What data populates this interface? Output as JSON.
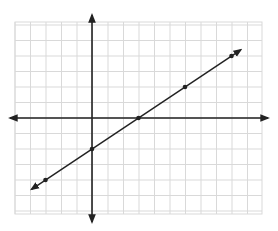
{
  "chart_data": {
    "type": "line",
    "title": "",
    "xlabel": "",
    "ylabel": "",
    "equation": "y = (2/3)x - 2",
    "slope": 0.6667,
    "y_intercept": -2,
    "x_intercept": 3,
    "grid": true,
    "xlim": [
      -5,
      11
    ],
    "ylim": [
      -6.2,
      6.2
    ],
    "series": [
      {
        "name": "line",
        "points": [
          [
            -3,
            -4
          ],
          [
            0,
            -2
          ],
          [
            3,
            0
          ],
          [
            6,
            2
          ],
          [
            9,
            4
          ]
        ],
        "x": [
          -3,
          0,
          3,
          6,
          9
        ],
        "y": [
          -4,
          -2,
          0,
          2,
          4
        ]
      }
    ],
    "tick_labels": false,
    "legend": "none"
  },
  "style": {
    "grid_color": "#d9d9d9",
    "axis_color": "#222222",
    "line_color": "#222222",
    "point_color": "#222222",
    "background": "#ffffff"
  },
  "layout": {
    "origin_px": [
      92,
      118
    ],
    "cell_px": 15.5,
    "grid_left": 15,
    "grid_right": 262,
    "grid_top": 22,
    "grid_bottom": 214
  }
}
